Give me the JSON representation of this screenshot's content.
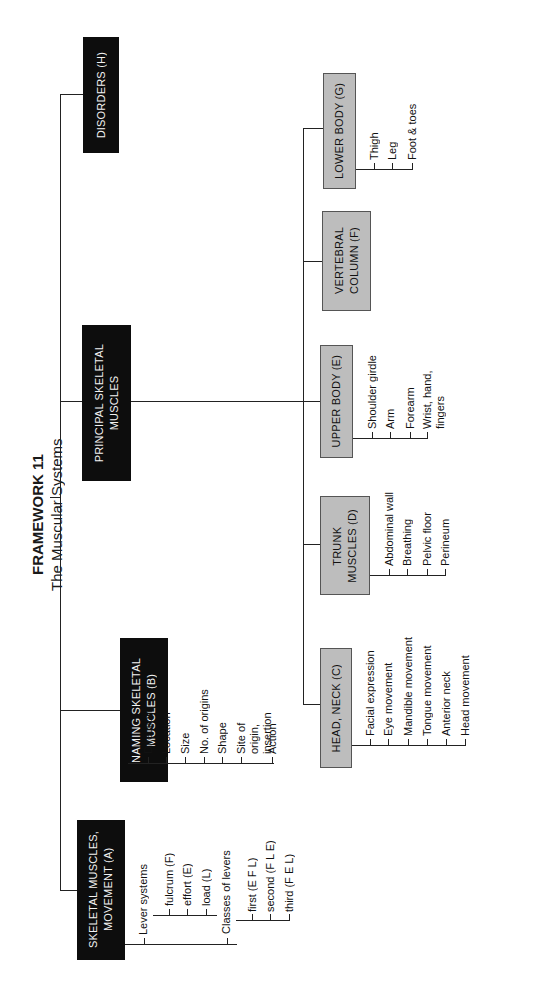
{
  "title": {
    "line1": "FRAMEWORK 11",
    "line2": "The Muscular Systems"
  },
  "branches": {
    "A": {
      "label": "SKELETAL MUSCLES,\nMOVEMENT (A)",
      "groups": [
        {
          "label": "Lever systems",
          "items": [
            "fulcrum (F)",
            "effort (E)",
            "load (L)"
          ]
        },
        {
          "label": "Classes of levers",
          "items": [
            "first (E F L)",
            "second (F L E)",
            "third (F E L)"
          ]
        }
      ]
    },
    "B": {
      "label": "NAMING SKELETAL\nMUSCLES (B)",
      "items": [
        "Direction",
        "Location",
        "Size",
        "No. of origins",
        "Shape",
        "Site of origin,\ninsertion",
        "Action"
      ]
    },
    "principal": {
      "label": "PRINCIPAL SKELETAL\nMUSCLES",
      "C": {
        "label": "HEAD, NECK (C)",
        "items": [
          "Facial expression",
          "Eye movement",
          "Mandible movement",
          "Tongue movement",
          "Anterior neck",
          "Head  movement"
        ]
      },
      "D": {
        "label": "TRUNK\nMUSCLES (D)",
        "items": [
          "Abdominal wall",
          "Breathing",
          "Pelvic floor",
          "Perineum"
        ]
      },
      "E": {
        "label": "UPPER BODY (E)",
        "items": [
          "Shoulder girdle",
          "Arm",
          "Forearm",
          "Wrist, hand,\nfingers"
        ]
      },
      "F": {
        "label": "VERTEBRAL\nCOLUMN (F)"
      },
      "G": {
        "label": "LOWER BODY (G)",
        "items": [
          "Thigh",
          "Leg",
          "Foot & toes"
        ]
      }
    },
    "H": {
      "label": "DISORDERS (H)"
    }
  },
  "colors": {
    "primary_box": "#0d0d0d",
    "secondary_box": "#bdbdbd",
    "line": "#222222"
  }
}
